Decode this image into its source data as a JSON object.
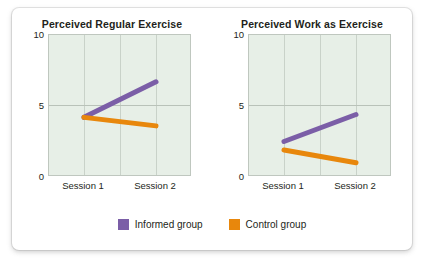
{
  "figure": {
    "legend": {
      "items": [
        {
          "label": "Informed group",
          "color": "#7B5EA7",
          "swatch_name": "legend-swatch-informed"
        },
        {
          "label": "Control group",
          "color": "#E8870C",
          "swatch_name": "legend-swatch-control"
        }
      ]
    }
  },
  "chart_data": [
    {
      "type": "line",
      "title": "Perceived Regular Exercise",
      "xlabel": "",
      "ylabel": "",
      "categories": [
        "Session 1",
        "Session 2"
      ],
      "ylim": [
        0,
        10
      ],
      "yticks": [
        0,
        5,
        10
      ],
      "ytick_labels": [
        "0",
        "5",
        "10"
      ],
      "grid": true,
      "legend_position": "bottom",
      "series": [
        {
          "name": "Informed group",
          "color": "#7B5EA7",
          "values": [
            4.2,
            6.7
          ]
        },
        {
          "name": "Control group",
          "color": "#E8870C",
          "values": [
            4.2,
            3.6
          ]
        }
      ]
    },
    {
      "type": "line",
      "title": "Perceived Work as Exercise",
      "xlabel": "",
      "ylabel": "",
      "categories": [
        "Session 1",
        "Session 2"
      ],
      "ylim": [
        0,
        10
      ],
      "yticks": [
        0,
        5,
        10
      ],
      "ytick_labels": [
        "0",
        "5",
        "10"
      ],
      "grid": true,
      "legend_position": "bottom",
      "series": [
        {
          "name": "Informed group",
          "color": "#7B5EA7",
          "values": [
            2.5,
            4.4
          ]
        },
        {
          "name": "Control group",
          "color": "#E8870C",
          "values": [
            1.9,
            1.0
          ]
        }
      ]
    }
  ]
}
